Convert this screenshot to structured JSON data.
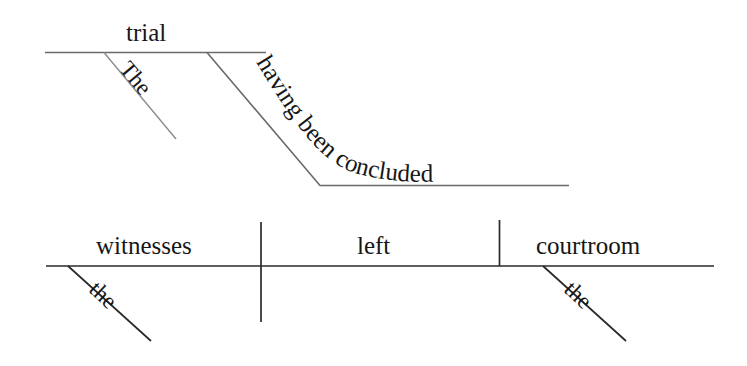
{
  "diagram": {
    "type": "reed-kellogg-sentence-diagram",
    "sentence": "The trial having been concluded, the witnesses left the courtroom.",
    "colors": {
      "background": "#ffffff",
      "line_dark": "#2a2a2a",
      "line_mid": "#6a6a6a",
      "line_light": "#8c8c8c",
      "text": "#161616"
    },
    "absolute_phrase": {
      "noun": "trial",
      "determiner": "The",
      "participle": "having been concluded"
    },
    "main_clause": {
      "subject": "witnesses",
      "subject_modifier": "the",
      "verb": "left",
      "object": "courtroom",
      "object_modifier": "the"
    }
  }
}
